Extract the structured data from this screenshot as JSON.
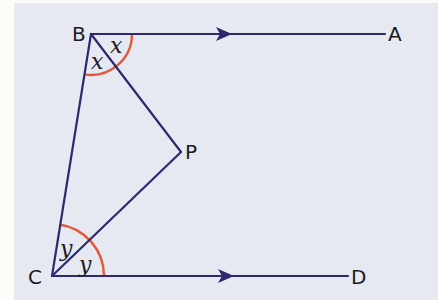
{
  "figure": {
    "type": "geometry-diagram",
    "colors": {
      "background": "#e7e9f2",
      "margin": "#fbfbf8",
      "lines": "#2b2a6e",
      "angle_arcs": "#e2593a",
      "text": "#1b1b1f"
    },
    "points": [
      {
        "id": "A",
        "label": "A",
        "x": 401,
        "y": 41
      },
      {
        "id": "B",
        "label": "B",
        "x": 72,
        "y": 41
      },
      {
        "id": "P",
        "label": "P",
        "x": 186,
        "y": 159
      },
      {
        "id": "C",
        "label": "C",
        "x": 29,
        "y": 283
      },
      {
        "id": "D",
        "label": "D",
        "x": 352,
        "y": 283
      }
    ],
    "angles": [
      {
        "vertex": "B",
        "label": "x",
        "between": "BA-BP"
      },
      {
        "vertex": "B",
        "label": "x",
        "between": "BP-BC"
      },
      {
        "vertex": "C",
        "label": "y",
        "between": "CB-CP"
      },
      {
        "vertex": "C",
        "label": "y",
        "between": "CP-CD"
      }
    ],
    "segments": [
      "BA",
      "BC",
      "BP",
      "CP",
      "CD"
    ],
    "parallel_marks": [
      "BA",
      "CD"
    ]
  }
}
